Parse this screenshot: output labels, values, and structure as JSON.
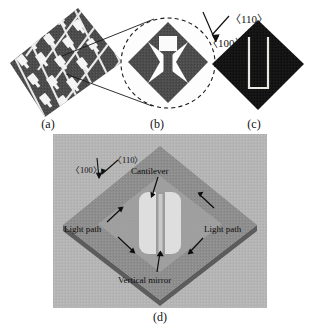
{
  "figure": {
    "type": "scientific-figure-micrographs",
    "background_color": "#ffffff",
    "panels": [
      {
        "id": "a",
        "caption": "(a)",
        "description": "Array of diamond-shaped membranes in a tilted grid",
        "kind": "sem-micrograph-array",
        "fill_color": "#4a4a4a",
        "gap_color": "#f2f2f2"
      },
      {
        "id": "b",
        "caption": "(b)",
        "description": "Magnified view of a single device within dashed ellipse",
        "kind": "sem-micrograph-detail",
        "fill_color": "#4a4a4a",
        "gap_color": "#fafafa"
      },
      {
        "id": "c",
        "caption": "(c)",
        "description": "Dark diamond with U-shaped released cantilever slot",
        "kind": "sem-micrograph-dark",
        "fill_color": "#121212",
        "slot_color": "#e8e8e4"
      },
      {
        "id": "d",
        "caption": "(d)",
        "description": "Tilted SEM view of the complete device",
        "kind": "sem-micrograph-tilted",
        "fill_color": "#8d8d8d"
      }
    ],
    "crystal_directions_c": [
      {
        "label": "〈110〉"
      },
      {
        "label": "〈100〉"
      }
    ],
    "crystal_directions_d": [
      {
        "label": "〈100〉"
      },
      {
        "label": "〈110〉"
      }
    ],
    "annotations_d": [
      {
        "label": "Cantilever"
      },
      {
        "label": "Light path"
      },
      {
        "label": "Light path"
      },
      {
        "label": "Vertical mirror"
      }
    ]
  }
}
